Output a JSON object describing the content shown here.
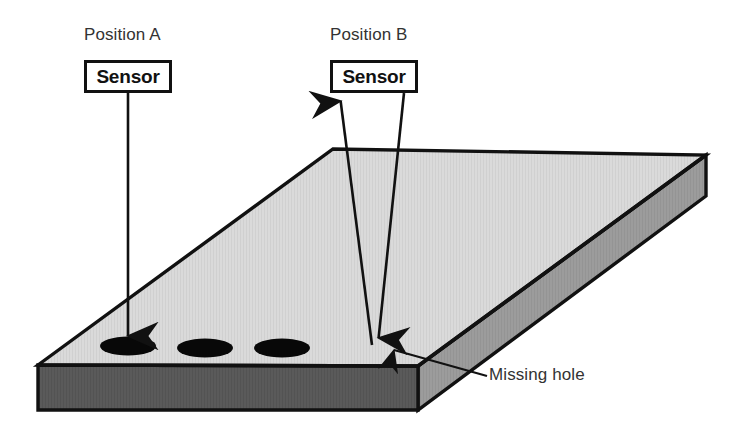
{
  "diagram": {
    "background_color": "#ffffff",
    "line_color": "#111111"
  },
  "annotations": {
    "position_a": {
      "label": "Position A",
      "sensor_label": "Sensor"
    },
    "position_b": {
      "label": "Position B",
      "sensor_label": "Sensor"
    },
    "missing_hole": {
      "label": "Missing hole"
    }
  },
  "plate": {
    "top_face_color": "#d9d9d9",
    "front_face_color": "#595959",
    "side_face_color": "#9a9a9a",
    "edge_color": "#111111",
    "hole_color": "#050505",
    "holes": [
      {
        "cx": 128,
        "cy": 346,
        "rx": 28,
        "ry": 9
      },
      {
        "cx": 205,
        "cy": 348,
        "rx": 28,
        "ry": 9
      },
      {
        "cx": 282,
        "cy": 348,
        "rx": 28,
        "ry": 9
      }
    ],
    "missing_hole_marker": {
      "cx": 378,
      "cy": 347
    }
  },
  "beams": {
    "position_a": {
      "from": {
        "x": 128,
        "y": 93
      },
      "to": {
        "x": 128,
        "y": 341
      },
      "direction": "down",
      "target_hole_index": 0
    },
    "position_b_incident": {
      "from": {
        "x": 404,
        "y": 93
      },
      "to": {
        "x": 378,
        "y": 344
      },
      "direction": "down"
    },
    "position_b_reflected": {
      "from": {
        "x": 371,
        "y": 344
      },
      "to": {
        "x": 340,
        "y": 95
      },
      "direction": "up"
    },
    "missing_hole_leader": {
      "from": {
        "x": 487,
        "y": 375
      },
      "to": {
        "x": 388,
        "y": 349
      },
      "direction": "up-left"
    }
  }
}
